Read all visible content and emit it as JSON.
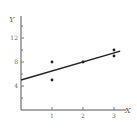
{
  "chart_data": {
    "type": "scatter",
    "title": "",
    "xlabel": "X",
    "ylabel": "Y",
    "xlim": [
      0,
      3.4
    ],
    "ylim": [
      0,
      15
    ],
    "x_ticks": [
      1,
      2,
      3
    ],
    "x_tick_labels": [
      "1",
      "2",
      "3"
    ],
    "y_ticks": [
      4,
      8,
      12
    ],
    "y_tick_labels": [
      "4",
      "8",
      "12"
    ],
    "y_minor_ticks": [
      2,
      6,
      10,
      14
    ],
    "grid": false,
    "points": [
      {
        "x": 1,
        "y": 8
      },
      {
        "x": 1,
        "y": 5
      },
      {
        "x": 2,
        "y": 8
      },
      {
        "x": 3,
        "y": 10
      },
      {
        "x": 3,
        "y": 9
      }
    ],
    "fit_line": {
      "intercept": 5,
      "slope": 1.5,
      "x_range": [
        0,
        3.2
      ]
    }
  }
}
